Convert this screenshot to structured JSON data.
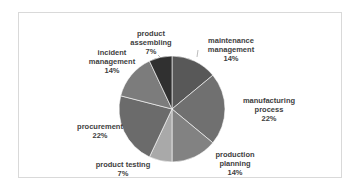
{
  "chart_data": {
    "type": "pie",
    "title": "",
    "categories": [
      "maintenance management",
      "manufacturing process",
      "production planning",
      "product testing",
      "procurement",
      "incident management",
      "product assembling"
    ],
    "values": [
      14,
      22,
      14,
      7,
      22,
      14,
      7
    ],
    "unit": "%",
    "start_angle": "12 o'clock",
    "direction": "clockwise",
    "colors": [
      "#585858",
      "#707070",
      "#828282",
      "#a9a9a9",
      "#6b6b6b",
      "#7c7c7c",
      "#303030"
    ],
    "legend": "none (data labels on chart)"
  },
  "labels": {
    "maintenance": {
      "line1": "maintenance",
      "line2": "management",
      "pct": "14%"
    },
    "manufacturing": {
      "line1": "manufacturing",
      "line2": "process",
      "pct": "22%"
    },
    "planning": {
      "line1": "production",
      "line2": "planning",
      "pct": "14%"
    },
    "testing": {
      "line1": "product testing",
      "pct": "7%"
    },
    "procurement": {
      "line1": "procurement",
      "pct": "22%"
    },
    "incident": {
      "line1": "incident",
      "line2": "management",
      "pct": "14%"
    },
    "assembling": {
      "line1": "product",
      "line2": "assembling",
      "pct": "7%"
    }
  }
}
